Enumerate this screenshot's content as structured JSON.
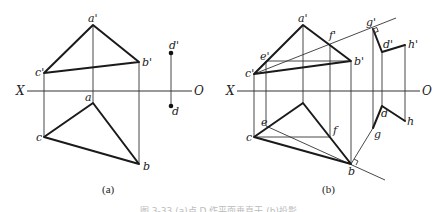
{
  "figure": {
    "caption_partial": "图 3-33  (a)点 D 作平面垂直于 (b)投影",
    "panels": [
      {
        "id": "a",
        "label": "(a)",
        "axis": {
          "left": "X",
          "right": "O"
        },
        "points": {
          "a_prime": "a'",
          "b_prime": "b'",
          "c_prime": "c'",
          "d_prime": "d'",
          "a": "a",
          "b": "b",
          "c": "c",
          "d": "d"
        }
      },
      {
        "id": "b",
        "label": "(b)",
        "axis": {
          "left": "X",
          "right": "O"
        },
        "points": {
          "a_prime": "a'",
          "b_prime": "b'",
          "c_prime": "c'",
          "d_prime": "d'",
          "e_prime": "e'",
          "f_prime": "f'",
          "g_prime": "g'",
          "h_prime": "h'",
          "b": "b",
          "c": "c",
          "d": "d",
          "e": "e",
          "f": "f",
          "g": "g",
          "h": "h"
        }
      }
    ]
  },
  "colors": {
    "line": "#1a1a1a",
    "background": "#ffffff"
  }
}
